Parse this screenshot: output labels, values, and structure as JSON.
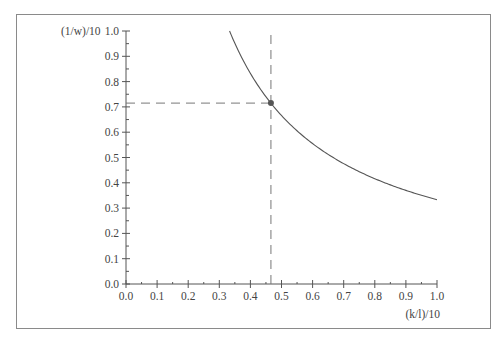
{
  "chart_data": {
    "type": "line",
    "title": "",
    "xlabel": "(k/l)/10",
    "ylabel": "(1/w)/10",
    "xlim": [
      0.0,
      1.0
    ],
    "ylim": [
      0.0,
      1.0
    ],
    "x_ticks": [
      "0.0",
      "0.1",
      "0.2",
      "0.3",
      "0.4",
      "0.5",
      "0.6",
      "0.7",
      "0.8",
      "0.9",
      "1.0"
    ],
    "y_ticks": [
      "0.0",
      "0.1",
      "0.2",
      "0.3",
      "0.4",
      "0.5",
      "0.6",
      "0.7",
      "0.8",
      "0.9",
      "1.0"
    ],
    "grid": false,
    "legend": null,
    "series": [
      {
        "name": "curve",
        "function": "y = 0.333 / x",
        "x": [
          0.333,
          0.35,
          0.4,
          0.45,
          0.5,
          0.6,
          0.7,
          0.8,
          0.9,
          1.0
        ],
        "y": [
          1.0,
          0.951,
          0.833,
          0.74,
          0.666,
          0.555,
          0.476,
          0.416,
          0.37,
          0.333
        ],
        "color": "#555555"
      }
    ],
    "annotations": [
      {
        "type": "point",
        "x": 0.466,
        "y": 0.715,
        "color": "#555555"
      },
      {
        "type": "dashed-vline",
        "x": 0.466,
        "from_y": 0.0,
        "to_y": 1.0
      },
      {
        "type": "dashed-hline",
        "y": 0.715,
        "from_x": 0.0,
        "to_x": 0.466
      }
    ]
  }
}
